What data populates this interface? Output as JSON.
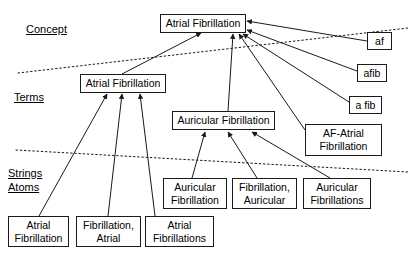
{
  "diagram": {
    "type": "hierarchy-mapping-diagram",
    "canvas": {
      "width": 408,
      "height": 259,
      "background": "#ffffff"
    },
    "ink_color": "#1a1a1a",
    "tier_labels": [
      {
        "id": "concept",
        "text": "Concept",
        "x": 26,
        "y": 23,
        "font_size": 11
      },
      {
        "id": "terms",
        "text": "Terms",
        "x": 14,
        "y": 91,
        "font_size": 11
      },
      {
        "id": "strings",
        "text": "Strings",
        "x": 8,
        "y": 167,
        "font_size": 11
      },
      {
        "id": "atoms",
        "text": "Atoms",
        "x": 8,
        "y": 181,
        "font_size": 11
      }
    ],
    "dividers": [
      {
        "id": "concept-terms-divider",
        "style": "dotted",
        "x1": 18,
        "y1": 73,
        "x2": 408,
        "y2": 28
      },
      {
        "id": "terms-strings-divider",
        "style": "dotted",
        "x1": 16,
        "y1": 150,
        "x2": 408,
        "y2": 172
      }
    ],
    "nodes": [
      {
        "id": "concept-atrial-fibrillation",
        "label": "Atrial Fibrillation",
        "tier": "concept",
        "x": 160,
        "y": 14,
        "w": 86,
        "h": 19,
        "font_size": 10.5
      },
      {
        "id": "term-atrial-fibrillation",
        "label": "Atrial Fibrillation",
        "tier": "terms",
        "x": 80,
        "y": 74,
        "w": 86,
        "h": 19,
        "font_size": 10.5
      },
      {
        "id": "term-auricular-fibrillation",
        "label": "Auricular Fibrillation",
        "tier": "terms",
        "x": 172,
        "y": 111,
        "w": 103,
        "h": 19,
        "font_size": 10.5
      },
      {
        "id": "term-af",
        "label": "af",
        "tier": "terms",
        "x": 367,
        "y": 32,
        "w": 25,
        "h": 18,
        "font_size": 10.5
      },
      {
        "id": "term-afib",
        "label": "afib",
        "tier": "terms",
        "x": 357,
        "y": 64,
        "w": 30,
        "h": 18,
        "font_size": 10.5
      },
      {
        "id": "term-a-fib",
        "label": "a fib",
        "tier": "terms",
        "x": 349,
        "y": 96,
        "w": 33,
        "h": 18,
        "font_size": 10.5
      },
      {
        "id": "term-af-atrial-fibrillation",
        "label": "AF-Atrial\nFibrillation",
        "tier": "terms",
        "x": 305,
        "y": 124,
        "w": 77,
        "h": 32,
        "font_size": 10.5
      },
      {
        "id": "atom-atrial-fibrillation",
        "label": "Atrial\nFibrillation",
        "tier": "atoms",
        "x": 8,
        "y": 216,
        "w": 61,
        "h": 31,
        "font_size": 10.5
      },
      {
        "id": "atom-fibrillation-atrial",
        "label": "Fibrillation,\nAtrial",
        "tier": "atoms",
        "x": 76,
        "y": 216,
        "w": 65,
        "h": 31,
        "font_size": 10.5
      },
      {
        "id": "atom-atrial-fibrillations",
        "label": "Atrial\nFibrillations",
        "tier": "atoms",
        "x": 145,
        "y": 216,
        "w": 69,
        "h": 31,
        "font_size": 10.5
      },
      {
        "id": "atom-auricular-fibrillation",
        "label": "Auricular\nFibrillation",
        "tier": "atoms",
        "x": 163,
        "y": 178,
        "w": 64,
        "h": 31,
        "font_size": 10.5
      },
      {
        "id": "atom-fibrillation-auricular",
        "label": "Fibrillation,\nAuricular",
        "tier": "atoms",
        "x": 232,
        "y": 178,
        "w": 65,
        "h": 31,
        "font_size": 10.5
      },
      {
        "id": "atom-auricular-fibrillations",
        "label": "Auricular\nFibrillations",
        "tier": "atoms",
        "x": 303,
        "y": 178,
        "w": 68,
        "h": 31,
        "font_size": 10.5
      }
    ],
    "edges": [
      {
        "id": "edge-term-af-to-concept",
        "from": "term-atrial-fibrillation",
        "to": "concept-atrial-fibrillation",
        "x1": 122,
        "y1": 74,
        "x2": 201,
        "y2": 33
      },
      {
        "id": "edge-af-to-concept",
        "from": "term-af",
        "to": "concept-atrial-fibrillation",
        "x1": 367,
        "y1": 41,
        "x2": 247,
        "y2": 21
      },
      {
        "id": "edge-afib-to-concept",
        "from": "term-afib",
        "to": "concept-atrial-fibrillation",
        "x1": 357,
        "y1": 71,
        "x2": 247,
        "y2": 30
      },
      {
        "id": "edge-a-fib-to-concept",
        "from": "term-a-fib",
        "to": "concept-atrial-fibrillation",
        "x1": 349,
        "y1": 102,
        "x2": 243,
        "y2": 34
      },
      {
        "id": "edge-af-atrial-to-concept",
        "from": "term-af-atrial-fibrillation",
        "to": "concept-atrial-fibrillation",
        "x1": 305,
        "y1": 130,
        "x2": 239,
        "y2": 34
      },
      {
        "id": "edge-auricular-to-concept",
        "from": "term-auricular-fibrillation",
        "to": "concept-atrial-fibrillation",
        "x1": 228,
        "y1": 111,
        "x2": 233,
        "y2": 34
      },
      {
        "id": "edge-atom1-to-term-af",
        "from": "atom-atrial-fibrillation",
        "to": "term-atrial-fibrillation",
        "x1": 39,
        "y1": 216,
        "x2": 107,
        "y2": 94
      },
      {
        "id": "edge-atom2-to-term-af",
        "from": "atom-fibrillation-atrial",
        "to": "term-atrial-fibrillation",
        "x1": 108,
        "y1": 216,
        "x2": 122,
        "y2": 94
      },
      {
        "id": "edge-atom3-to-term-af",
        "from": "atom-atrial-fibrillations",
        "to": "term-atrial-fibrillation",
        "x1": 155,
        "y1": 216,
        "x2": 140,
        "y2": 94
      },
      {
        "id": "edge-atom4-to-term-auricular",
        "from": "atom-auricular-fibrillation",
        "to": "term-auricular-fibrillation",
        "x1": 192,
        "y1": 178,
        "x2": 205,
        "y2": 132
      },
      {
        "id": "edge-atom5-to-term-auricular",
        "from": "atom-fibrillation-auricular",
        "to": "term-auricular-fibrillation",
        "x1": 257,
        "y1": 178,
        "x2": 228,
        "y2": 132
      },
      {
        "id": "edge-atom6-to-term-auricular",
        "from": "atom-auricular-fibrillations",
        "to": "term-auricular-fibrillation",
        "x1": 330,
        "y1": 178,
        "x2": 252,
        "y2": 132
      }
    ]
  }
}
